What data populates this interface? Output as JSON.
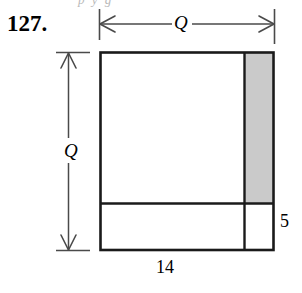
{
  "page": {
    "background_color": "#ffffff",
    "ink_color": "#1a1a1a",
    "shade_color": "#cccccc"
  },
  "problem": {
    "number_label": "127.",
    "clipped_top_text": "p y g"
  },
  "figure": {
    "name": "square-with-border-strips-diagram",
    "outer_square": {
      "label": "outer-square",
      "x": 100,
      "y": 52,
      "width": 173,
      "height": 198
    },
    "shaded_strip": {
      "label": "shaded-vertical-strip",
      "x": 244,
      "y": 53,
      "width": 28,
      "height": 150,
      "fill": "#cccccc"
    },
    "horizontal_divider": {
      "y": 203,
      "x1": 100,
      "x2": 273
    },
    "vertical_divider": {
      "x": 244,
      "y1": 52,
      "y2": 250
    }
  },
  "dimensions": {
    "top": {
      "label": "Q",
      "name": "q-horizontal-dimension",
      "axis_y": 24,
      "x1": 99,
      "x2": 274,
      "tick_top": 9,
      "tick_bottom": 40,
      "arrows": "both"
    },
    "left": {
      "label": "Q",
      "name": "q-vertical-dimension",
      "axis_x": 68,
      "y1": 52,
      "y2": 250,
      "tick_left": 56,
      "tick_right": 88,
      "arrows": "both"
    },
    "right_side": {
      "label": "5",
      "name": "side-length-5"
    },
    "bottom_side": {
      "label": "14",
      "name": "side-length-14"
    }
  }
}
